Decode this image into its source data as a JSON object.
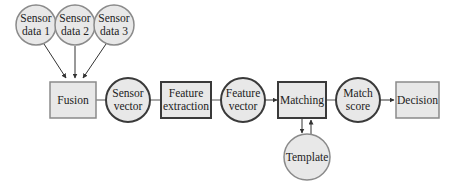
{
  "diagram": {
    "colors": {
      "fill": "#e8e8e8",
      "stroke_light": "#8a8a8a",
      "stroke_dark": "#3a3a3a",
      "text": "#222222",
      "edge": "#333333"
    },
    "nodes": {
      "sensor_data_1": {
        "shape": "circle",
        "line1": "Sensor",
        "line2": "data 1"
      },
      "sensor_data_2": {
        "shape": "circle",
        "line1": "Sensor",
        "line2": "data 2"
      },
      "sensor_data_3": {
        "shape": "circle",
        "line1": "Sensor",
        "line2": "data 3"
      },
      "fusion": {
        "shape": "box",
        "label": "Fusion"
      },
      "sensor_vector": {
        "shape": "circle",
        "line1": "Sensor",
        "line2": "vector"
      },
      "feature_extraction": {
        "shape": "box",
        "line1": "Feature",
        "line2": "extraction"
      },
      "feature_vector": {
        "shape": "circle",
        "line1": "Feature",
        "line2": "vector"
      },
      "matching": {
        "shape": "box",
        "label": "Matching"
      },
      "match_score": {
        "shape": "circle",
        "line1": "Match",
        "line2": "score"
      },
      "decision": {
        "shape": "box",
        "label": "Decision"
      },
      "template": {
        "shape": "circle",
        "label": "Template"
      }
    },
    "edges": [
      {
        "from": "sensor_data_1",
        "to": "fusion",
        "arrow": true
      },
      {
        "from": "sensor_data_2",
        "to": "fusion",
        "arrow": true
      },
      {
        "from": "sensor_data_3",
        "to": "fusion",
        "arrow": true
      },
      {
        "from": "fusion",
        "to": "sensor_vector",
        "arrow": false
      },
      {
        "from": "sensor_vector",
        "to": "feature_extraction",
        "arrow": false
      },
      {
        "from": "feature_extraction",
        "to": "feature_vector",
        "arrow": false
      },
      {
        "from": "feature_vector",
        "to": "matching",
        "arrow": true
      },
      {
        "from": "matching",
        "to": "match_score",
        "arrow": false
      },
      {
        "from": "match_score",
        "to": "decision",
        "arrow": true
      },
      {
        "from": "matching",
        "to": "template",
        "arrow": true
      },
      {
        "from": "template",
        "to": "matching",
        "arrow": true
      }
    ]
  }
}
